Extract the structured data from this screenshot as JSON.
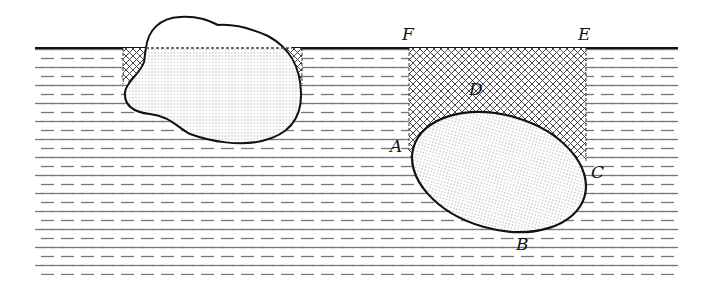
{
  "figure": {
    "liquid": {
      "surface_y": 48,
      "left": 35,
      "right": 678,
      "bottom": 275
    },
    "left_body": {
      "label": "irregular-floating-body"
    },
    "right_body": {
      "label": "elliptical-submerged-body"
    },
    "labels": {
      "F": "F",
      "E": "E",
      "D": "D",
      "A": "A",
      "C": "C",
      "B": "B"
    }
  }
}
